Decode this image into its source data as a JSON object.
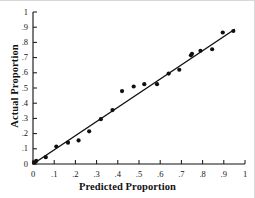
{
  "chart_data": {
    "type": "scatter",
    "title": "",
    "xlabel": "Predicted Proportion",
    "ylabel": "Actual Proportion",
    "xlim": [
      0,
      1
    ],
    "ylim": [
      0,
      1
    ],
    "grid": false,
    "legend": null,
    "xticks": [
      "0",
      ".1",
      ".2",
      ".3",
      ".4",
      ".5",
      ".6",
      ".7",
      ".8",
      ".9",
      "1"
    ],
    "xtick_values": [
      0,
      0.1,
      0.2,
      0.3,
      0.4,
      0.5,
      0.6,
      0.7,
      0.8,
      0.9,
      1
    ],
    "yticks": [
      "0",
      ".1",
      ".2",
      ".3",
      ".4",
      ".5",
      ".6",
      ".7",
      ".8",
      ".9",
      "1"
    ],
    "ytick_values": [
      0,
      0.1,
      0.2,
      0.3,
      0.4,
      0.5,
      0.6,
      0.7,
      0.8,
      0.9,
      1
    ],
    "marker": "filled-circle",
    "marker_color": "#101010",
    "line_color": "#101010",
    "points": [
      {
        "x": 0.005,
        "y": 0.01
      },
      {
        "x": 0.015,
        "y": 0.02
      },
      {
        "x": 0.06,
        "y": 0.045
      },
      {
        "x": 0.11,
        "y": 0.115
      },
      {
        "x": 0.165,
        "y": 0.14
      },
      {
        "x": 0.215,
        "y": 0.155
      },
      {
        "x": 0.265,
        "y": 0.215
      },
      {
        "x": 0.32,
        "y": 0.295
      },
      {
        "x": 0.375,
        "y": 0.355
      },
      {
        "x": 0.42,
        "y": 0.48
      },
      {
        "x": 0.475,
        "y": 0.51
      },
      {
        "x": 0.525,
        "y": 0.525
      },
      {
        "x": 0.585,
        "y": 0.525
      },
      {
        "x": 0.64,
        "y": 0.595
      },
      {
        "x": 0.69,
        "y": 0.62
      },
      {
        "x": 0.745,
        "y": 0.715
      },
      {
        "x": 0.75,
        "y": 0.725
      },
      {
        "x": 0.79,
        "y": 0.745
      },
      {
        "x": 0.845,
        "y": 0.755
      },
      {
        "x": 0.895,
        "y": 0.865
      },
      {
        "x": 0.945,
        "y": 0.875
      }
    ],
    "fit_line": {
      "x0": 0.0,
      "y0": 0.0,
      "x1": 0.95,
      "y1": 0.885
    }
  }
}
